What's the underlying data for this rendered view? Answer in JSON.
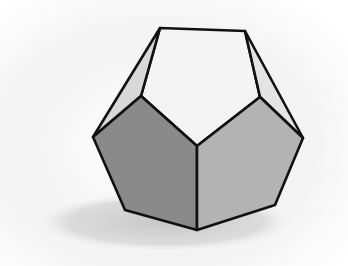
{
  "illustration": {
    "subject": "dodecahedron",
    "colors": {
      "background": "#ffffff",
      "backdrop_gradient": "#e6e6e6",
      "shadow": "#cfcfcf",
      "top_face": "#f4f4f4",
      "left_side_face": "#d6d6d6",
      "right_side_face": "#e2e2e2",
      "front_left_face": "#8a8a8a",
      "front_right_face": "#b3b3b3",
      "edge": "#111111"
    }
  }
}
